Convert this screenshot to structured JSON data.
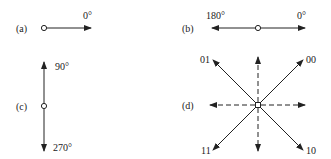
{
  "panels": {
    "a": {
      "label": "(a)",
      "angle": "0°"
    },
    "b": {
      "label": "(b)",
      "angle_left": "180°",
      "angle_right": "0°"
    },
    "c": {
      "label": "(c)",
      "angle_top": "90°",
      "angle_bottom": "270°"
    },
    "d": {
      "label": "(d)",
      "code_ne": "00",
      "code_nw": "01",
      "code_sw": "11",
      "code_se": "10"
    }
  },
  "colors": {
    "stroke": "#222222",
    "background": "#ffffff"
  }
}
